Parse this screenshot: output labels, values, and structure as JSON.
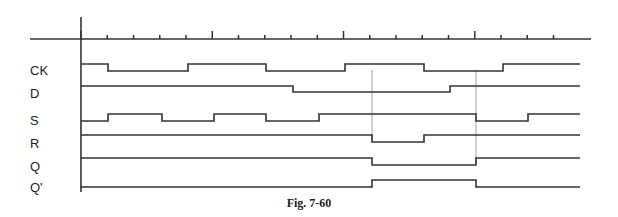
{
  "figure": {
    "caption": "Fig. 7-60",
    "type": "timing-diagram"
  },
  "axis": {
    "origin_x": 81,
    "horizontal_y": 39,
    "horizontal_from_x": 30,
    "horizontal_to_x": 591,
    "vertical_top_y": 17,
    "vertical_bottom_y": 192,
    "tick_spacing_px": 26.25,
    "tick_count": 19,
    "tall_tick_indices": [
      0,
      5,
      10,
      15
    ],
    "stroke": "#333333"
  },
  "guides": [
    {
      "x": 372,
      "from_y": 70,
      "to_y": 140
    },
    {
      "x": 476,
      "from_y": 70,
      "to_y": 165
    }
  ],
  "signals": [
    {
      "name": "CK",
      "label_y": 70,
      "high_y": 64,
      "low_y": 71,
      "segments": [
        [
          81,
          108,
          1
        ],
        [
          108,
          188,
          0
        ],
        [
          188,
          266,
          1
        ],
        [
          266,
          345,
          0
        ],
        [
          345,
          424,
          1
        ],
        [
          424,
          503,
          0
        ],
        [
          503,
          580,
          1
        ]
      ],
      "tail": [
        [
          372,
          424,
          1
        ],
        [
          424,
          476,
          0
        ],
        [
          476,
          528,
          1
        ],
        [
          528,
          580,
          0
        ]
      ]
    },
    {
      "name": "D",
      "label_y": 93,
      "high_y": 86,
      "low_y": 92,
      "segments": [
        [
          81,
          293,
          1
        ],
        [
          293,
          450,
          0
        ],
        [
          450,
          580,
          1
        ]
      ]
    },
    {
      "name": "S",
      "label_y": 120,
      "high_y": 114,
      "low_y": 121,
      "segments": [
        [
          81,
          108,
          0
        ],
        [
          108,
          162,
          1
        ],
        [
          162,
          214,
          0
        ],
        [
          214,
          266,
          1
        ],
        [
          266,
          319,
          0
        ],
        [
          319,
          476,
          1
        ],
        [
          476,
          528,
          0
        ],
        [
          528,
          580,
          1
        ]
      ]
    },
    {
      "name": "R",
      "label_y": 143,
      "high_y": 135,
      "low_y": 142,
      "segments": [
        [
          81,
          372,
          1
        ],
        [
          372,
          424,
          0
        ],
        [
          424,
          580,
          1
        ]
      ]
    },
    {
      "name": "Q",
      "label_y": 166,
      "high_y": 158,
      "low_y": 165,
      "segments": [
        [
          81,
          372,
          1
        ],
        [
          372,
          476,
          0
        ],
        [
          476,
          580,
          1
        ]
      ]
    },
    {
      "name": "Q'",
      "label_y": 188,
      "high_y": 180,
      "low_y": 187,
      "segments": [
        [
          81,
          372,
          0
        ],
        [
          372,
          476,
          1
        ],
        [
          476,
          580,
          0
        ]
      ]
    }
  ],
  "labels": {
    "ck": "CK",
    "d": "D",
    "s": "S",
    "r": "R",
    "q": "Q",
    "qbar": "Q'"
  }
}
